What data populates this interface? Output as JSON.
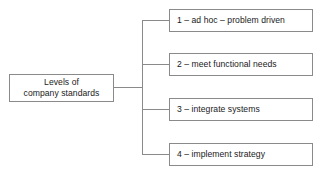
{
  "diagram": {
    "type": "tree",
    "orientation": "left-to-right",
    "root": {
      "label": "Levels of\ncompany standards"
    },
    "branches": [
      {
        "label": "1 – ad hoc – problem driven"
      },
      {
        "label": "2 – meet functional needs"
      },
      {
        "label": "3 – integrate systems"
      },
      {
        "label": "4 – implement strategy"
      }
    ],
    "colors": {
      "background": "#ffffff",
      "border": "#8a8a8a",
      "text": "#1a1a1a",
      "connector": "#8a8a8a"
    }
  }
}
